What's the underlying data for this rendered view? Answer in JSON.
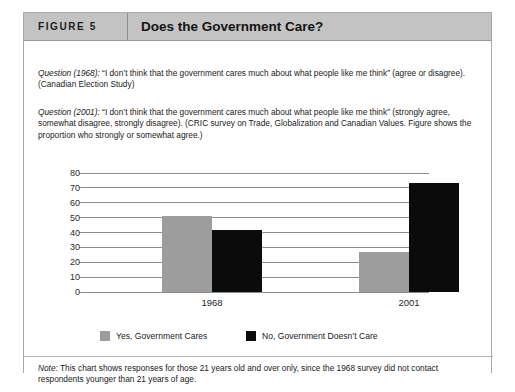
{
  "figure": {
    "number_label": "FIGURE 5",
    "title": "Does the Government Care?"
  },
  "questions": [
    {
      "label": "Question (1968):",
      "text": " “I don’t think that the government cares much about what people like me think” (agree or disagree). (Canadian Election Study)"
    },
    {
      "label": "Question (2001):",
      "text": " “I don’t think that the government cares much about what people like me think” (strongly agree, somewhat disagree, strongly disagree). (CRIC survey on Trade, Globalization and Canadian Values. Figure shows the proportion who strongly or somewhat agree.)"
    }
  ],
  "note": {
    "label": "Note:",
    "text": " This chart shows responses for those 21 years old and over only, since the 1968 survey did not contact respondents younger than 21 years of age."
  },
  "legend": [
    {
      "label": "Yes, Government Cares",
      "color": "#9d9d9d"
    },
    {
      "label": "No, Government Doesn’t Care",
      "color": "#0b0b0b"
    }
  ],
  "chart_data": {
    "type": "bar",
    "title": "Does the Government Care?",
    "categories": [
      "1968",
      "2001"
    ],
    "series": [
      {
        "name": "Yes, Government Cares",
        "color": "#9d9d9d",
        "values": [
          51,
          27
        ]
      },
      {
        "name": "No, Government Doesn’t Care",
        "color": "#0b0b0b",
        "values": [
          42,
          73
        ]
      }
    ],
    "xlabel": "",
    "ylabel": "",
    "ylim": [
      0,
      80
    ],
    "yticks": [
      0,
      10,
      20,
      30,
      40,
      50,
      60,
      70,
      80
    ],
    "ytick_labels": [
      "0",
      "10",
      "20",
      "30",
      "40",
      "50",
      "60",
      "70",
      "80"
    ],
    "grid": true,
    "legend_position": "bottom"
  }
}
